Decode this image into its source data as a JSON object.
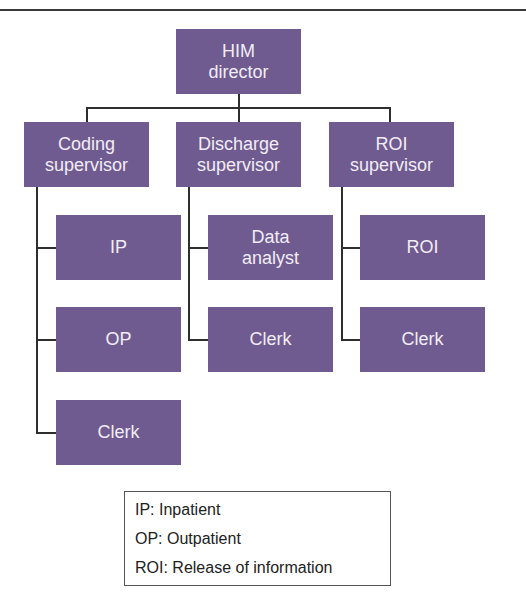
{
  "diagram": {
    "type": "org-chart",
    "colors": {
      "box_fill": "#6f5b8f",
      "box_text": "#f1edf6",
      "line": "#2e2e2e"
    },
    "root": {
      "line1": "HIM",
      "line2": "director"
    },
    "supervisors": [
      {
        "line1": "Coding",
        "line2": "supervisor",
        "children": [
          {
            "line1": "IP"
          },
          {
            "line1": "OP"
          },
          {
            "line1": "Clerk"
          }
        ]
      },
      {
        "line1": "Discharge",
        "line2": "supervisor",
        "children": [
          {
            "line1": "Data",
            "line2": "analyst"
          },
          {
            "line1": "Clerk"
          }
        ]
      },
      {
        "line1": "ROI",
        "line2": "supervisor",
        "children": [
          {
            "line1": "ROI"
          },
          {
            "line1": "Clerk"
          }
        ]
      }
    ]
  },
  "legend": {
    "items": [
      "IP: Inpatient",
      "OP: Outpatient",
      "ROI: Release of information"
    ]
  }
}
